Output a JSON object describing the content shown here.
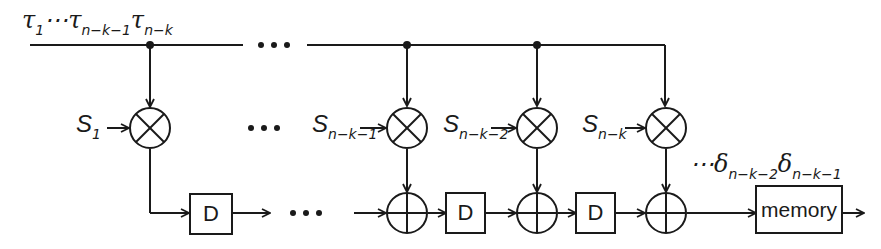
{
  "diagram": {
    "input_label": {
      "symbol": "τ",
      "parts": [
        {
          "text": "τ",
          "sub": "1"
        },
        {
          "text": "⋯τ",
          "sub": "n−k−1"
        },
        {
          "text": "τ",
          "sub": "n−k"
        }
      ]
    },
    "coefficients": [
      {
        "symbol": "S",
        "sub": "1"
      },
      {
        "symbol": "S",
        "sub": "n−k−1"
      },
      {
        "symbol": "S",
        "sub": "n−k−2"
      },
      {
        "symbol": "S",
        "sub": "n−k"
      }
    ],
    "multiplier_glyph": "multiply-circle",
    "adder_glyph": "add-circle",
    "delay_label": "D",
    "delay_count": 3,
    "memory_label": "memory",
    "output_label": {
      "prefix": "⋯",
      "parts": [
        {
          "text": "δ",
          "sub": "n−k−2"
        },
        {
          "text": "δ",
          "sub": "n−k−1"
        }
      ]
    },
    "ellipsis": "• • •",
    "colors": {
      "line": "#1a1a1a",
      "background": "#ffffff"
    }
  }
}
